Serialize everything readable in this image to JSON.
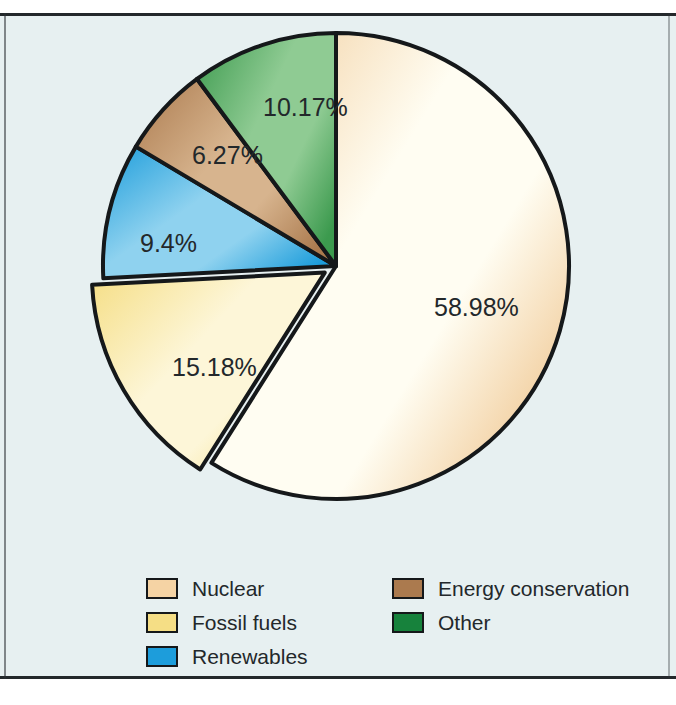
{
  "chart_data": {
    "type": "pie",
    "title": "",
    "subtitle": "",
    "xlabel": "",
    "ylabel": "",
    "grid": false,
    "legend_position": "bottom",
    "categories": [
      "Nuclear",
      "Fossil fuels",
      "Renewables",
      "Energy conservation",
      "Other"
    ],
    "values": [
      58.98,
      15.18,
      9.4,
      6.27,
      10.17
    ],
    "labels": [
      "58.98%",
      "15.18%",
      "9.4%",
      "6.27%",
      "10.17%"
    ],
    "units": "percent",
    "total": 100.0,
    "start_angle_deg": 90,
    "direction": "counterclockwise",
    "exploded_slices": [
      "Fossil fuels"
    ],
    "slices": [
      {
        "name": "Nuclear",
        "value": 58.98,
        "label": "58.98%",
        "color": "#f0c893",
        "color_light": "#fffdf2",
        "exploded": false,
        "label_x": 398,
        "label_y": 300
      },
      {
        "name": "Fossil fuels",
        "value": 15.18,
        "label": "15.18%",
        "color": "#f5de85",
        "color_light": "#fdf6d8",
        "exploded": true,
        "label_x": 136,
        "label_y": 360
      },
      {
        "name": "Renewables",
        "value": 9.4,
        "label": "9.4%",
        "color": "#1d9ddb",
        "color_light": "#8fd2ef",
        "exploded": false,
        "label_x": 104,
        "label_y": 236
      },
      {
        "name": "Energy conservation",
        "value": 6.27,
        "label": "6.27%",
        "color": "#ab7a4e",
        "color_light": "#d7b48e",
        "exploded": false,
        "label_x": 156,
        "label_y": 148
      },
      {
        "name": "Other",
        "value": 10.17,
        "label": "10.17%",
        "color": "#3c9a4e",
        "color_light": "#8fcb93",
        "exploded": false,
        "label_x": 227,
        "label_y": 100
      }
    ]
  },
  "legend": {
    "columns": [
      {
        "items": [
          {
            "label": "Nuclear",
            "color": "#f5d3a4"
          },
          {
            "label": "Fossil fuels",
            "color": "#f5de85"
          },
          {
            "label": "Renewables",
            "color": "#1d9ddb"
          }
        ]
      },
      {
        "items": [
          {
            "label": "Energy conservation",
            "color": "#ab7a4e"
          },
          {
            "label": "Other",
            "color": "#17823c"
          }
        ]
      }
    ]
  },
  "colors": {
    "background": "#e7f0f1",
    "frame": "#23282b",
    "outline": "#15181a",
    "text": "#23282b"
  }
}
